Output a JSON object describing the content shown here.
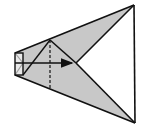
{
  "diagram": {
    "type": "folding-diagram",
    "colors": {
      "fill": "#c8c8c8",
      "stroke": "#111111",
      "background": "#ffffff"
    },
    "points": {
      "top_right": [
        134,
        5
      ],
      "bottom_right": [
        135,
        123
      ],
      "rect_top_left": [
        15,
        53
      ],
      "rect_bottom_left": [
        15,
        75
      ],
      "rect_top_right": [
        23,
        53
      ],
      "rect_bottom_right": [
        23,
        75
      ],
      "peak": [
        50,
        40
      ],
      "center": [
        76,
        63
      ],
      "dash_bottom": [
        50,
        88
      ]
    },
    "arrow": {
      "from": [
        15,
        63
      ],
      "to": [
        72,
        63
      ],
      "direction": "right"
    },
    "dashed_line": {
      "from": [
        50,
        40
      ],
      "to": [
        50,
        88
      ]
    }
  }
}
